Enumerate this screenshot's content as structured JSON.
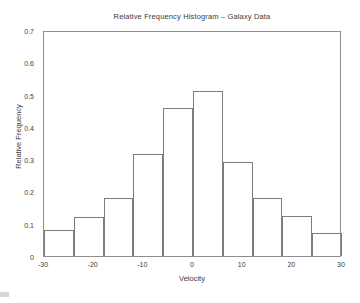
{
  "chart_data": {
    "type": "bar",
    "title": "Relative Frequency Histogram – Galaxy Data",
    "xlabel": "Velocity",
    "ylabel": "Relative Frequency",
    "xlim": [
      -30,
      30
    ],
    "ylim": [
      0,
      0.7
    ],
    "grid": false,
    "legend": null,
    "bin_width": 6,
    "bin_edges": [
      -30,
      -24,
      -18,
      -12,
      -6,
      0,
      6,
      12,
      18,
      24,
      30
    ],
    "categories": [
      "-30 to -24",
      "-24 to -18",
      "-18 to -12",
      "-12 to -6",
      "-6 to 0",
      "0 to 6",
      "6 to 12",
      "12 to 18",
      "18 to 24",
      "24 to 30"
    ],
    "values": [
      0.08,
      0.12,
      0.18,
      0.315,
      0.46,
      0.51,
      0.29,
      0.18,
      0.125,
      0.07
    ],
    "xticks": [
      -30,
      -20,
      -10,
      0,
      10,
      20,
      30
    ],
    "xtick_labels": [
      "-30",
      "-20",
      "-10",
      "0",
      "10",
      "20",
      "30"
    ],
    "yticks": [
      0,
      0.1,
      0.2,
      0.3,
      0.4,
      0.5,
      0.6,
      0.7
    ],
    "ytick_labels": [
      "0",
      "0.1",
      "0.2",
      "0.3",
      "0.4",
      "0.5",
      "0.6",
      "0.7"
    ],
    "colors": {
      "bar_edge": "#7d7d7d",
      "bar_fill": "#ffffff",
      "axis": "#8e8e8e",
      "text": "#3c3c3c",
      "background": "#ffffff"
    }
  }
}
